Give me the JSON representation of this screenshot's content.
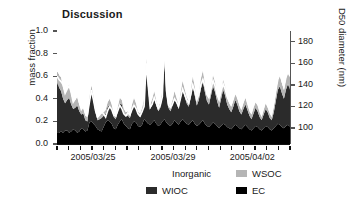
{
  "figure": {
    "title": "Discussion",
    "background": "#ffffff"
  },
  "axes": {
    "left": {
      "label": "mass fraction",
      "ticks": [
        "0.0",
        "0.2",
        "0.4",
        "0.6",
        "0.8",
        "1.0"
      ],
      "min": 0.0,
      "max": 1.0
    },
    "right": {
      "label": "D50 diameter (nm)",
      "ticks": [
        "100",
        "120",
        "140",
        "160",
        "180"
      ],
      "min": 85,
      "max": 190
    },
    "bottom": {
      "ticks": [
        "2005/03/25",
        "2005/03/29",
        "2005/04/02"
      ]
    }
  },
  "legend": {
    "items": [
      {
        "label": "Inorganic",
        "color": "#ffffff",
        "swatch": "sw-inorg"
      },
      {
        "label": "WSOC",
        "color": "#b5b5b5",
        "swatch": "sw-wsoc"
      },
      {
        "label": "WIOC",
        "color": "#2b2b2b",
        "swatch": "sw-wioc"
      },
      {
        "label": "EC",
        "color": "#000000",
        "swatch": "sw-ec"
      }
    ]
  },
  "chart_data": {
    "type": "area",
    "title": "Discussion",
    "xlabel": "",
    "ylabel": "mylabel-mass fraction",
    "y2label": "D50 diameter (nm)",
    "ylim": [
      0.0,
      1.0
    ],
    "y2lim": [
      85,
      190
    ],
    "grid": false,
    "legend_position": "bottom",
    "stacked": true,
    "stack_order_bottom_to_top": [
      "EC",
      "WIOC",
      "WSOC",
      "Inorganic"
    ],
    "x_start": "2005/03/23",
    "x_end": "2005/04/04",
    "n_points": 116,
    "x_tick_labels": [
      "2005/03/25",
      "2005/03/29",
      "2005/04/02"
    ],
    "x_tick_positions_frac": [
      0.155,
      0.498,
      0.838
    ],
    "series": [
      {
        "name": "EC",
        "color": "#000000",
        "values": [
          0.1,
          0.1,
          0.11,
          0.1,
          0.12,
          0.12,
          0.1,
          0.11,
          0.13,
          0.12,
          0.1,
          0.11,
          0.14,
          0.13,
          0.11,
          0.12,
          0.19,
          0.2,
          0.18,
          0.16,
          0.13,
          0.12,
          0.11,
          0.15,
          0.19,
          0.21,
          0.2,
          0.18,
          0.14,
          0.13,
          0.17,
          0.2,
          0.22,
          0.18,
          0.16,
          0.14,
          0.13,
          0.18,
          0.2,
          0.19,
          0.16,
          0.15,
          0.17,
          0.22,
          0.2,
          0.18,
          0.17,
          0.19,
          0.21,
          0.18,
          0.16,
          0.17,
          0.2,
          0.22,
          0.19,
          0.17,
          0.16,
          0.18,
          0.21,
          0.19,
          0.17,
          0.2,
          0.22,
          0.2,
          0.18,
          0.17,
          0.19,
          0.21,
          0.18,
          0.16,
          0.17,
          0.19,
          0.21,
          0.18,
          0.16,
          0.15,
          0.17,
          0.19,
          0.18,
          0.16,
          0.14,
          0.16,
          0.18,
          0.17,
          0.15,
          0.14,
          0.13,
          0.15,
          0.17,
          0.16,
          0.14,
          0.13,
          0.15,
          0.17,
          0.15,
          0.13,
          0.12,
          0.14,
          0.16,
          0.15,
          0.13,
          0.12,
          0.14,
          0.16,
          0.15,
          0.13,
          0.12,
          0.14,
          0.16,
          0.18,
          0.17,
          0.15,
          0.14,
          0.16,
          0.17,
          0.15
        ]
      },
      {
        "name": "WIOC",
        "color": "#2b2b2b",
        "values": [
          0.44,
          0.4,
          0.36,
          0.3,
          0.24,
          0.27,
          0.31,
          0.24,
          0.18,
          0.2,
          0.24,
          0.18,
          0.12,
          0.14,
          0.1,
          0.08,
          0.18,
          0.26,
          0.2,
          0.12,
          0.08,
          0.1,
          0.12,
          0.1,
          0.08,
          0.12,
          0.15,
          0.13,
          0.1,
          0.09,
          0.12,
          0.16,
          0.13,
          0.1,
          0.09,
          0.11,
          0.1,
          0.13,
          0.16,
          0.13,
          0.1,
          0.09,
          0.11,
          0.14,
          0.5,
          0.3,
          0.14,
          0.16,
          0.2,
          0.16,
          0.13,
          0.15,
          0.22,
          0.5,
          0.25,
          0.15,
          0.13,
          0.16,
          0.2,
          0.17,
          0.14,
          0.2,
          0.26,
          0.22,
          0.18,
          0.16,
          0.22,
          0.3,
          0.25,
          0.18,
          0.22,
          0.3,
          0.34,
          0.28,
          0.22,
          0.2,
          0.26,
          0.32,
          0.28,
          0.22,
          0.18,
          0.24,
          0.3,
          0.26,
          0.2,
          0.17,
          0.15,
          0.18,
          0.22,
          0.19,
          0.15,
          0.13,
          0.16,
          0.18,
          0.15,
          0.12,
          0.1,
          0.13,
          0.16,
          0.14,
          0.11,
          0.09,
          0.12,
          0.15,
          0.13,
          0.1,
          0.09,
          0.14,
          0.22,
          0.3,
          0.34,
          0.3,
          0.26,
          0.32,
          0.36,
          0.33
        ]
      },
      {
        "name": "WSOC",
        "color": "#b5b5b5",
        "values": [
          0.1,
          0.11,
          0.12,
          0.1,
          0.09,
          0.1,
          0.12,
          0.09,
          0.06,
          0.07,
          0.08,
          0.06,
          0.05,
          0.05,
          0.04,
          0.04,
          0.05,
          0.06,
          0.05,
          0.04,
          0.03,
          0.04,
          0.04,
          0.03,
          0.03,
          0.04,
          0.05,
          0.04,
          0.03,
          0.03,
          0.04,
          0.05,
          0.04,
          0.03,
          0.03,
          0.04,
          0.03,
          0.04,
          0.05,
          0.04,
          0.03,
          0.03,
          0.04,
          0.05,
          0.06,
          0.05,
          0.04,
          0.05,
          0.06,
          0.05,
          0.04,
          0.05,
          0.06,
          0.07,
          0.06,
          0.05,
          0.04,
          0.05,
          0.06,
          0.05,
          0.04,
          0.06,
          0.08,
          0.07,
          0.06,
          0.05,
          0.07,
          0.09,
          0.08,
          0.06,
          0.07,
          0.09,
          0.1,
          0.08,
          0.07,
          0.06,
          0.08,
          0.1,
          0.09,
          0.07,
          0.06,
          0.08,
          0.09,
          0.08,
          0.06,
          0.05,
          0.05,
          0.06,
          0.07,
          0.06,
          0.05,
          0.04,
          0.05,
          0.06,
          0.05,
          0.04,
          0.04,
          0.05,
          0.05,
          0.05,
          0.04,
          0.03,
          0.04,
          0.05,
          0.04,
          0.04,
          0.03,
          0.05,
          0.07,
          0.09,
          0.1,
          0.09,
          0.08,
          0.1,
          0.11,
          0.1
        ]
      },
      {
        "name": "Inorganic",
        "color": "#ffffff",
        "values": [
          0.36,
          0.39,
          0.41,
          0.5,
          0.55,
          0.51,
          0.47,
          0.56,
          0.63,
          0.61,
          0.58,
          0.65,
          0.69,
          0.68,
          0.75,
          0.76,
          0.58,
          0.48,
          0.57,
          0.68,
          0.76,
          0.74,
          0.73,
          0.72,
          0.7,
          0.63,
          0.6,
          0.65,
          0.73,
          0.75,
          0.67,
          0.59,
          0.61,
          0.69,
          0.72,
          0.71,
          0.74,
          0.65,
          0.59,
          0.64,
          0.71,
          0.73,
          0.68,
          0.59,
          0.24,
          0.47,
          0.65,
          0.6,
          0.53,
          0.61,
          0.67,
          0.63,
          0.52,
          0.21,
          0.5,
          0.63,
          0.67,
          0.61,
          0.53,
          0.59,
          0.65,
          0.54,
          0.44,
          0.51,
          0.58,
          0.62,
          0.52,
          0.4,
          0.49,
          0.6,
          0.54,
          0.42,
          0.35,
          0.46,
          0.55,
          0.59,
          0.49,
          0.39,
          0.45,
          0.55,
          0.62,
          0.52,
          0.43,
          0.49,
          0.59,
          0.64,
          0.67,
          0.61,
          0.54,
          0.59,
          0.66,
          0.7,
          0.64,
          0.59,
          0.65,
          0.71,
          0.74,
          0.68,
          0.63,
          0.66,
          0.72,
          0.76,
          0.7,
          0.64,
          0.68,
          0.73,
          0.76,
          0.67,
          0.55,
          0.43,
          0.39,
          0.46,
          0.52,
          0.42,
          0.36,
          0.42
        ]
      }
    ],
    "overlay_line": {
      "name": "D50 diameter",
      "color": "#ffffff",
      "axis": "right",
      "unit": "nm",
      "values": [
        148,
        145,
        143,
        140,
        132,
        136,
        139,
        133,
        124,
        127,
        131,
        124,
        117,
        120,
        114,
        112,
        124,
        135,
        126,
        116,
        110,
        112,
        115,
        113,
        110,
        116,
        120,
        117,
        112,
        111,
        116,
        121,
        118,
        113,
        111,
        114,
        112,
        117,
        121,
        118,
        113,
        111,
        115,
        120,
        160,
        140,
        119,
        122,
        128,
        123,
        118,
        121,
        129,
        182,
        135,
        121,
        119,
        122,
        127,
        124,
        120,
        128,
        136,
        131,
        126,
        123,
        131,
        140,
        134,
        126,
        131,
        140,
        145,
        139,
        131,
        128,
        136,
        144,
        139,
        131,
        126,
        134,
        141,
        136,
        129,
        125,
        122,
        127,
        133,
        129,
        124,
        121,
        126,
        130,
        126,
        120,
        117,
        123,
        128,
        125,
        119,
        116,
        122,
        127,
        124,
        118,
        116,
        124,
        135,
        145,
        150,
        144,
        138,
        147,
        152,
        148
      ]
    }
  }
}
